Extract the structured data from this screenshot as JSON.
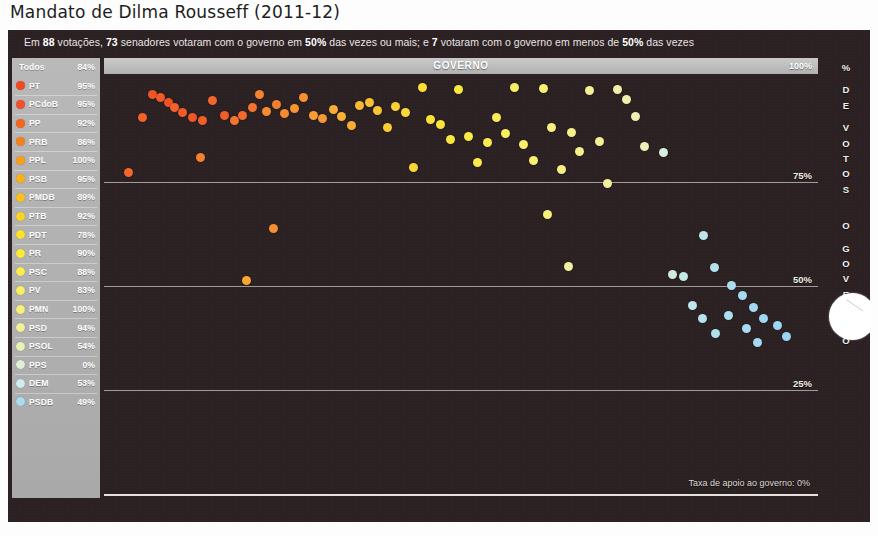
{
  "title": "Mandato de Dilma Rousseff (2011-12)",
  "headline": {
    "parts": [
      {
        "t": "Em ",
        "b": false
      },
      {
        "t": "88",
        "b": true
      },
      {
        "t": " votações, ",
        "b": false
      },
      {
        "t": "73",
        "b": true
      },
      {
        "t": " senadores votaram com o governo em ",
        "b": false
      },
      {
        "t": "50%",
        "b": true
      },
      {
        "t": " das vezes ou mais; e ",
        "b": false
      },
      {
        "t": "7",
        "b": true
      },
      {
        "t": " votaram com o governo em menos de ",
        "b": false
      },
      {
        "t": "50%",
        "b": true
      },
      {
        "t": " das vezes",
        "b": false
      }
    ]
  },
  "legend": {
    "header": {
      "label": "Todos",
      "value": "84%"
    },
    "items": [
      {
        "label": "PT",
        "value": "95%",
        "color": "#f04a22"
      },
      {
        "label": "PCdoB",
        "value": "95%",
        "color": "#f2512a"
      },
      {
        "label": "PP",
        "value": "92%",
        "color": "#f4661f"
      },
      {
        "label": "PRB",
        "value": "86%",
        "color": "#f5811e"
      },
      {
        "label": "PPL",
        "value": "100%",
        "color": "#f8a01d"
      },
      {
        "label": "PSB",
        "value": "95%",
        "color": "#f9b01d"
      },
      {
        "label": "PMDB",
        "value": "89%",
        "color": "#fac01e"
      },
      {
        "label": "PTB",
        "value": "92%",
        "color": "#fbd420"
      },
      {
        "label": "PDT",
        "value": "78%",
        "color": "#fce22a"
      },
      {
        "label": "PR",
        "value": "90%",
        "color": "#fbe93c"
      },
      {
        "label": "PSC",
        "value": "88%",
        "color": "#faec4e"
      },
      {
        "label": "PV",
        "value": "83%",
        "color": "#f8ef63"
      },
      {
        "label": "PMN",
        "value": "100%",
        "color": "#f6f07c"
      },
      {
        "label": "PSD",
        "value": "94%",
        "color": "#f2f09a"
      },
      {
        "label": "PSOL",
        "value": "54%",
        "color": "#eaf0b8"
      },
      {
        "label": "PPS",
        "value": "0%",
        "color": "#dff0d4"
      },
      {
        "label": "DEM",
        "value": "53%",
        "color": "#cfecee"
      },
      {
        "label": "PSDB",
        "value": "49%",
        "color": "#a9dcf0"
      }
    ]
  },
  "plot": {
    "gov_bar_label": "GOVERNO",
    "gov_bar_max": "100%",
    "footnote": "Taxa de apoio ao governo: 0%",
    "gridlabels": [
      "75%",
      "50%",
      "25%"
    ]
  },
  "vaxis": {
    "letters": [
      "%",
      "",
      "D",
      "E",
      "",
      "V",
      "O",
      "T",
      "O",
      "S",
      "",
      "",
      "",
      "O",
      "",
      "G",
      "O",
      "V",
      "E",
      "R",
      "N",
      "O"
    ]
  },
  "chart_data": {
    "type": "scatter",
    "title": "Mandato de Dilma Rousseff (2011-12)",
    "xlabel": "",
    "ylabel": "% DE VOTOS COM O GOVERNO",
    "ylim": [
      0,
      100
    ],
    "yticks": [
      0,
      25,
      50,
      75,
      100
    ],
    "grid": true,
    "legend_position": "left",
    "note": "Cada ponto é um senador; cor indica partido (vermelho = mais à esquerda da lista, azul = menos apoio).",
    "points": [
      {
        "x": 3.8,
        "y": 90.5,
        "color": "#f0622a"
      },
      {
        "x": 5.2,
        "y": 96.0,
        "color": "#ef5526"
      },
      {
        "x": 6.4,
        "y": 95.4,
        "color": "#f05a28"
      },
      {
        "x": 7.6,
        "y": 94.2,
        "color": "#ef5225"
      },
      {
        "x": 8.4,
        "y": 93.0,
        "color": "#f2622c"
      },
      {
        "x": 9.6,
        "y": 91.6,
        "color": "#f05e28"
      },
      {
        "x": 11.0,
        "y": 90.6,
        "color": "#ef5727"
      },
      {
        "x": 12.4,
        "y": 89.8,
        "color": "#f15f29"
      },
      {
        "x": 13.8,
        "y": 94.6,
        "color": "#f2652c"
      },
      {
        "x": 15.6,
        "y": 90.9,
        "color": "#f15d28"
      },
      {
        "x": 17.0,
        "y": 89.9,
        "color": "#f4742f"
      },
      {
        "x": 18.2,
        "y": 91.1,
        "color": "#f36a2c"
      },
      {
        "x": 19.6,
        "y": 92.8,
        "color": "#f4732f"
      },
      {
        "x": 1.8,
        "y": 77.2,
        "color": "#f2652c"
      },
      {
        "x": 12.2,
        "y": 80.8,
        "color": "#f5812f"
      },
      {
        "x": 20.6,
        "y": 96.0,
        "color": "#f5832f"
      },
      {
        "x": 21.6,
        "y": 92.0,
        "color": "#f68c30"
      },
      {
        "x": 23.0,
        "y": 93.6,
        "color": "#f57f2f"
      },
      {
        "x": 24.2,
        "y": 91.4,
        "color": "#f68a31"
      },
      {
        "x": 25.6,
        "y": 92.6,
        "color": "#f79531"
      },
      {
        "x": 27.0,
        "y": 95.2,
        "color": "#f69031"
      },
      {
        "x": 28.4,
        "y": 91.0,
        "color": "#f89d32"
      },
      {
        "x": 29.6,
        "y": 90.2,
        "color": "#f79832"
      },
      {
        "x": 22.6,
        "y": 63.8,
        "color": "#f68f31"
      },
      {
        "x": 18.8,
        "y": 51.3,
        "color": "#f9a733"
      },
      {
        "x": 31.2,
        "y": 92.4,
        "color": "#f9ab33"
      },
      {
        "x": 32.4,
        "y": 90.8,
        "color": "#fab233"
      },
      {
        "x": 33.8,
        "y": 88.6,
        "color": "#f9ae33"
      },
      {
        "x": 35.0,
        "y": 93.4,
        "color": "#fab934"
      },
      {
        "x": 36.4,
        "y": 94.0,
        "color": "#fbc034"
      },
      {
        "x": 37.6,
        "y": 92.2,
        "color": "#fac534"
      },
      {
        "x": 39.0,
        "y": 88.0,
        "color": "#fbcb35"
      },
      {
        "x": 40.2,
        "y": 93.2,
        "color": "#fbd235"
      },
      {
        "x": 41.6,
        "y": 91.6,
        "color": "#fcd836"
      },
      {
        "x": 42.8,
        "y": 78.4,
        "color": "#fbd536"
      },
      {
        "x": 44.0,
        "y": 97.6,
        "color": "#fcde36"
      },
      {
        "x": 45.2,
        "y": 90.0,
        "color": "#fce137"
      },
      {
        "x": 46.6,
        "y": 88.8,
        "color": "#fce537"
      },
      {
        "x": 48.0,
        "y": 85.2,
        "color": "#fbe63b"
      },
      {
        "x": 49.2,
        "y": 97.2,
        "color": "#fbe83f"
      },
      {
        "x": 50.6,
        "y": 86.0,
        "color": "#fbea44"
      },
      {
        "x": 52.0,
        "y": 79.6,
        "color": "#faeb4a"
      },
      {
        "x": 53.4,
        "y": 84.4,
        "color": "#faec50"
      },
      {
        "x": 54.6,
        "y": 90.4,
        "color": "#f9ed57"
      },
      {
        "x": 56.0,
        "y": 86.6,
        "color": "#f9ee5d"
      },
      {
        "x": 57.2,
        "y": 97.8,
        "color": "#f8ee63"
      },
      {
        "x": 58.6,
        "y": 84.0,
        "color": "#f8ef6a"
      },
      {
        "x": 60.0,
        "y": 80.2,
        "color": "#f7ef70"
      },
      {
        "x": 61.4,
        "y": 97.4,
        "color": "#f7f076"
      },
      {
        "x": 62.6,
        "y": 88.2,
        "color": "#f6f07c"
      },
      {
        "x": 64.0,
        "y": 78.0,
        "color": "#f6f082"
      },
      {
        "x": 65.4,
        "y": 86.8,
        "color": "#f5f088"
      },
      {
        "x": 66.6,
        "y": 82.4,
        "color": "#f5f08e"
      },
      {
        "x": 68.0,
        "y": 97.0,
        "color": "#f4f093"
      },
      {
        "x": 69.4,
        "y": 84.8,
        "color": "#f3f098"
      },
      {
        "x": 70.6,
        "y": 74.6,
        "color": "#f3f09d"
      },
      {
        "x": 72.0,
        "y": 97.2,
        "color": "#f0efa6"
      },
      {
        "x": 73.4,
        "y": 94.8,
        "color": "#eef0ac"
      },
      {
        "x": 74.6,
        "y": 90.8,
        "color": "#ecf0b2"
      },
      {
        "x": 76.0,
        "y": 83.6,
        "color": "#eaf0b8"
      },
      {
        "x": 62.0,
        "y": 67.2,
        "color": "#f6f07c"
      },
      {
        "x": 65.0,
        "y": 54.6,
        "color": "#eff0a0"
      },
      {
        "x": 78.6,
        "y": 82.2,
        "color": "#d6eedd"
      },
      {
        "x": 84.4,
        "y": 62.2,
        "color": "#bee6e8"
      },
      {
        "x": 86.0,
        "y": 54.4,
        "color": "#b4e2ec"
      },
      {
        "x": 88.4,
        "y": 50.2,
        "color": "#abddef"
      },
      {
        "x": 90.0,
        "y": 47.6,
        "color": "#a6dbf0"
      },
      {
        "x": 91.6,
        "y": 44.8,
        "color": "#a2d9f1"
      },
      {
        "x": 93.0,
        "y": 42.2,
        "color": "#9fd7f2"
      },
      {
        "x": 80.0,
        "y": 52.8,
        "color": "#cdecdc"
      },
      {
        "x": 81.6,
        "y": 52.2,
        "color": "#c3e9e6"
      },
      {
        "x": 82.8,
        "y": 45.2,
        "color": "#bde6ea"
      },
      {
        "x": 84.2,
        "y": 42.2,
        "color": "#b6e3ec"
      },
      {
        "x": 86.2,
        "y": 38.6,
        "color": "#b0e0ed"
      },
      {
        "x": 88.0,
        "y": 43.0,
        "color": "#ace0ef"
      },
      {
        "x": 90.6,
        "y": 39.8,
        "color": "#a8dcf0"
      },
      {
        "x": 92.2,
        "y": 36.4,
        "color": "#a5dbf0"
      },
      {
        "x": 95.0,
        "y": 40.6,
        "color": "#9dd6f2"
      },
      {
        "x": 96.4,
        "y": 37.8,
        "color": "#9ad5f3"
      }
    ]
  }
}
